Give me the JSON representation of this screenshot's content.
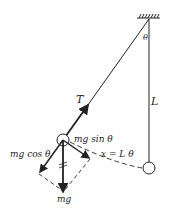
{
  "diagram": {
    "type": "simple pendulum force diagram",
    "labels": {
      "theta_top": "θ",
      "length": "L",
      "tension": "T",
      "mg_sin": "mg sin θ",
      "mg_cos": "mg cos θ",
      "arc": "x = L θ",
      "weight": "mg"
    },
    "colors": {
      "line": "#222222",
      "background": "#ffffff"
    }
  }
}
